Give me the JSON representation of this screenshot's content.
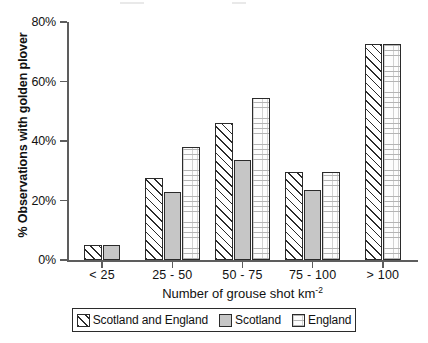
{
  "chart_data": {
    "type": "bar",
    "title": "",
    "xlabel": "Number of grouse shot km-2",
    "xlabel_base": "Number of grouse shot km",
    "xlabel_exponent": "-2",
    "ylabel": "% Observations with golden plover",
    "categories": [
      "< 25",
      "25 - 50",
      "50 - 75",
      "75 - 100",
      "> 100"
    ],
    "ylim": [
      0,
      80
    ],
    "yticks": [
      0,
      20,
      40,
      60,
      80
    ],
    "ytick_labels": [
      "0%",
      "20%",
      "40%",
      "60%",
      "80%"
    ],
    "grid": false,
    "legend_position": "below-axis",
    "series": [
      {
        "name": "Scotland and England",
        "pattern": "diagonal-hatch",
        "values": [
          5,
          27.5,
          46,
          29.5,
          72.5
        ]
      },
      {
        "name": "Scotland",
        "pattern": "solid-grey",
        "values": [
          5,
          23,
          33.5,
          23.5,
          null
        ]
      },
      {
        "name": "England",
        "pattern": "dotted",
        "values": [
          null,
          38,
          54.5,
          29.5,
          72.5
        ]
      }
    ]
  },
  "colors": {
    "axis": "#5d5d5d",
    "bar_outline": "#2b2b2b",
    "scotland_fill": "#c6c6c6",
    "england_fill": "#fdfdfd",
    "background": "#ffffff"
  }
}
